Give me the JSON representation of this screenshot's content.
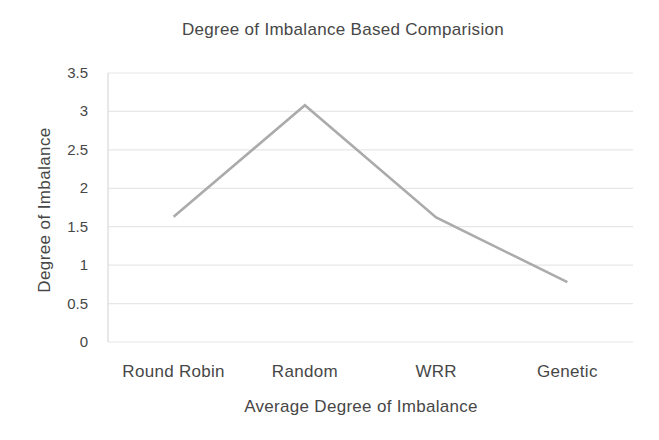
{
  "chart_data": {
    "type": "line",
    "title": "Degree of Imbalance Based Comparision",
    "xlabel": "Average Degree of Imbalance",
    "ylabel": "Degree of Imbalance",
    "categories": [
      "Round Robin",
      "Random",
      "WRR",
      "Genetic"
    ],
    "series": [
      {
        "name": "Average Degree of Imbalance",
        "values": [
          1.63,
          3.08,
          1.62,
          0.78
        ]
      }
    ],
    "ylim": [
      0,
      3.5
    ],
    "ytick_interval": 0.5,
    "yticks": [
      "0",
      "0.5",
      "1",
      "1.5",
      "2",
      "2.5",
      "3",
      "3.5"
    ],
    "grid": "horizontal-only",
    "legend": "none",
    "colors": {
      "line": "#ababab",
      "gridline": "#e7e7e7",
      "axis_line": "#d9d9d9",
      "text": "#474747",
      "background": "#ffffff"
    }
  }
}
